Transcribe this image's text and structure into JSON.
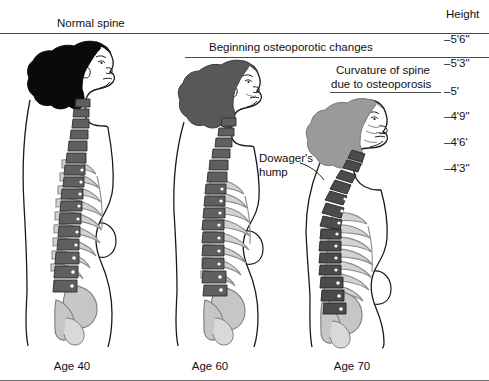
{
  "diagram": {
    "background_color": "#ffffff",
    "line_color": "#4a4a4a"
  },
  "annotations": {
    "normal_spine": "Normal spine",
    "beginning_changes": "Beginning osteoporotic changes",
    "curvature_line1": "Curvature of spine",
    "curvature_line2": "due to osteoporosis",
    "dowagers_line1": "Dowager's",
    "dowagers_line2": "hump"
  },
  "height_axis": {
    "title": "Height",
    "ticks": [
      {
        "label": "–5'6\"",
        "y": 33
      },
      {
        "label": "–5'3\"",
        "y": 57
      },
      {
        "label": "–5'",
        "y": 91
      },
      {
        "label": "–4'9\"",
        "y": 116
      },
      {
        "label": "–4'6'",
        "y": 142
      },
      {
        "label": "–4'3\"",
        "y": 168
      }
    ]
  },
  "guide_lines": [
    {
      "name": "line-5-6",
      "x1": 0,
      "x2": 489,
      "y": 33
    },
    {
      "name": "line-5-3",
      "x1": 185,
      "x2": 489,
      "y": 57
    },
    {
      "name": "line-5-0",
      "x1": 330,
      "x2": 441,
      "y": 92
    }
  ],
  "figures": [
    {
      "id": "figure-age-40",
      "age_label": "Age 40",
      "hair_color": "#0a0a0a",
      "spine_state": "normal",
      "height_mark": "–5'6\""
    },
    {
      "id": "figure-age-60",
      "age_label": "Age 60",
      "hair_color": "#585858",
      "spine_state": "beginning osteoporotic changes",
      "height_mark": "–5'3\""
    },
    {
      "id": "figure-age-70",
      "age_label": "Age 70",
      "hair_color": "#9a9a9a",
      "spine_state": "curvature of spine due to osteoporosis",
      "height_mark": "–5'"
    }
  ],
  "colors": {
    "vertebrae": "#5f5f5f",
    "vertebrae_dark": "#4b4b4b",
    "ribs": "#d2d2d2",
    "pelvis": "#c6c6c6",
    "skin_outline": "#1a1a1a",
    "text": "#111111"
  }
}
